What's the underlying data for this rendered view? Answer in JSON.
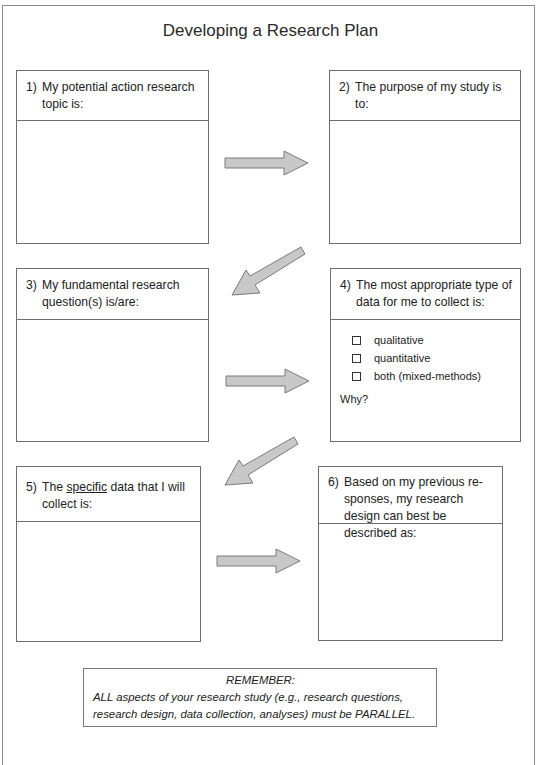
{
  "title": "Developing a Research Plan",
  "boxes": [
    {
      "num": "1)",
      "text": "My potential action research topic is:"
    },
    {
      "num": "2)",
      "text": "The purpose of my study is to:"
    },
    {
      "num": "3)",
      "text": "My fundamental research question(s) is/are:"
    },
    {
      "num": "4)",
      "text": "The most appropriate type of data for me to collect is:",
      "options": [
        "qualitative",
        "quantitative",
        "both (mixed-methods)"
      ],
      "why": "Why?"
    },
    {
      "num": "5)",
      "text_before": "The ",
      "text_underlined": "specific",
      "text_after": " data that I will collect is:"
    },
    {
      "num": "6)",
      "text": "Based on my previous re-sponses, my research design can best be described as:"
    }
  ],
  "arrows": [
    {
      "from": 1,
      "to": 2,
      "direction": "right"
    },
    {
      "from": 2,
      "to": 3,
      "direction": "down-left"
    },
    {
      "from": 3,
      "to": 4,
      "direction": "right"
    },
    {
      "from": 4,
      "to": 5,
      "direction": "down-left"
    },
    {
      "from": 5,
      "to": 6,
      "direction": "right"
    }
  ],
  "remember": {
    "heading": "REMEMBER:",
    "body": "ALL aspects of your research study (e.g., research questions, research design, data collection, analyses) must be PARALLEL."
  },
  "colors": {
    "arrow_fill": "#c8c8c8",
    "arrow_stroke": "#7a7a7a",
    "border": "#6e6e6e"
  }
}
